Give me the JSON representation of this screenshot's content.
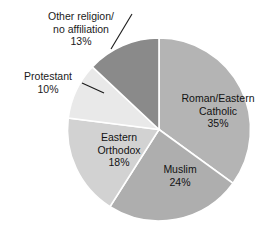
{
  "chart_data": {
    "type": "pie",
    "title": "",
    "subtitle": "",
    "xlabel": "",
    "ylabel": "",
    "legend_position": "none",
    "grid": false,
    "start_angle_deg": 0,
    "direction": "clockwise",
    "categories": [
      "Roman/Eastern Catholic",
      "Muslim",
      "Eastern Orthodox",
      "Protestant",
      "Other religion/no affiliation"
    ],
    "values": [
      35,
      24,
      18,
      10,
      13
    ],
    "value_labels": [
      "35%",
      "24%",
      "18%",
      "10%",
      "13%"
    ],
    "colors": [
      "#b4b4b4",
      "#aeaeae",
      "#d2d2d2",
      "#e9e9e9",
      "#8a8a8a"
    ],
    "slices": [
      {
        "name": "Roman/Eastern Catholic",
        "value": 35,
        "value_label": "35%",
        "color": "#b4b4b4",
        "label_lines": [
          "Roman/Eastern",
          "Catholic",
          "35%"
        ],
        "label_placement": "inside"
      },
      {
        "name": "Muslim",
        "value": 24,
        "value_label": "24%",
        "color": "#aeaeae",
        "label_lines": [
          "Muslim",
          "24%"
        ],
        "label_placement": "inside"
      },
      {
        "name": "Eastern Orthodox",
        "value": 18,
        "value_label": "18%",
        "color": "#d2d2d2",
        "label_lines": [
          "Eastern",
          "Orthodox",
          "18%"
        ],
        "label_placement": "inside"
      },
      {
        "name": "Protestant",
        "value": 10,
        "value_label": "10%",
        "color": "#e9e9e9",
        "label_lines": [
          "Protestant",
          "10%"
        ],
        "label_placement": "outside-leader"
      },
      {
        "name": "Other religion/no affiliation",
        "value": 13,
        "value_label": "13%",
        "color": "#8a8a8a",
        "label_lines": [
          "Other religion/",
          "no affiliation",
          "13%"
        ],
        "label_placement": "outside-leader"
      }
    ]
  },
  "labels": {
    "other": {
      "line1": "Other religion/",
      "line2": "no affiliation",
      "line3": "13%"
    },
    "protestant": {
      "line1": "Protestant",
      "line2": "10%"
    },
    "catholic": {
      "line1": "Roman/Eastern",
      "line2": "Catholic",
      "line3": "35%"
    },
    "orthodox": {
      "line1": "Eastern",
      "line2": "Orthodox",
      "line3": "18%"
    },
    "muslim": {
      "line1": "Muslim",
      "line2": "24%"
    }
  }
}
